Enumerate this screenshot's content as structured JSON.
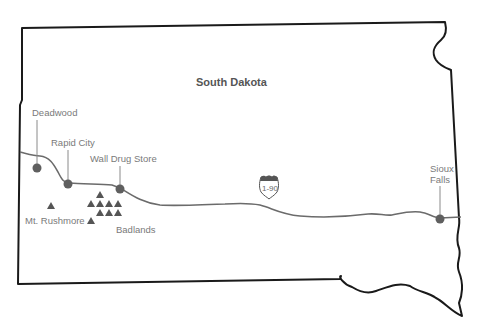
{
  "map": {
    "title": "South Dakota",
    "highway": {
      "name": "I-90",
      "shield_label": "1-90"
    },
    "cities": [
      {
        "name": "Deadwood"
      },
      {
        "name": "Rapid City"
      },
      {
        "name": "Wall Drug Store"
      },
      {
        "name": "Sioux Falls",
        "label_lines": [
          "Sioux",
          "Falls"
        ]
      }
    ],
    "landmarks": [
      {
        "name": "Mt. Rushmore",
        "icon": "mountain-icon"
      },
      {
        "name": "Badlands",
        "icon": "mountain-cluster-icon"
      }
    ],
    "colors": {
      "border": "#1a1a1a",
      "highway": "#6b6b6b",
      "city_dot": "#5f5f5f",
      "label": "#7a7a7a"
    }
  }
}
